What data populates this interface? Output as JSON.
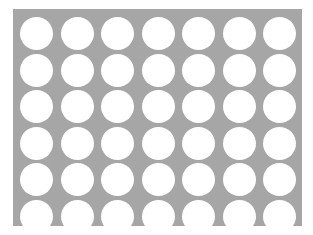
{
  "pattern": {
    "description": "Perforated plate with circular holes",
    "rows": 6,
    "columns": 7,
    "plate_color": "#a6a6a6",
    "hole_color": "#ffffff",
    "background_color": "#ffffff"
  }
}
